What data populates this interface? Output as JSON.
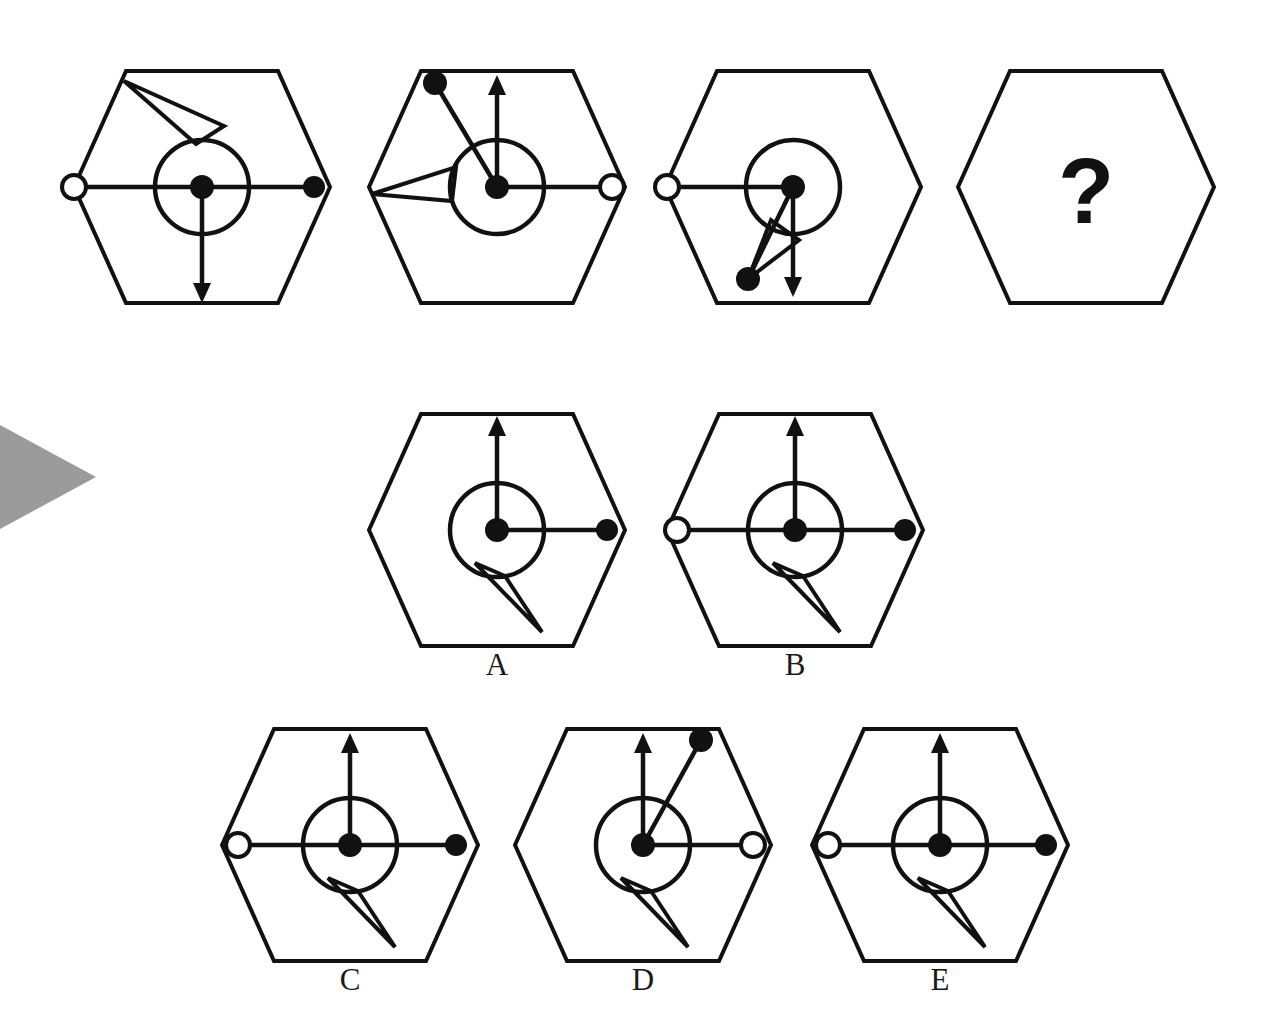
{
  "puzzle": {
    "kind": "visual-analogy-matrix",
    "question_mark": "?",
    "background_color": "#ffffff",
    "ink_color": "#111111",
    "marker_color": "#9b9b9b"
  },
  "marker": {
    "name": "row-pointer-triangle",
    "x": 0,
    "y": 425,
    "width": 96,
    "height": 104
  },
  "geometry": {
    "hex_half_width": 128,
    "hex_half_height": 116,
    "hex_flat_half": 76,
    "inner_circle_r": 47,
    "dot_r": 11,
    "open_dot_r": 12
  },
  "top_row": {
    "name": "question-row",
    "cells": [
      {
        "id": "q1",
        "cx": 202,
        "cy": 187,
        "elements": {
          "circle": true,
          "center_dot": "filled",
          "left_spoke": {
            "present": true,
            "end": "open-dot",
            "angle_deg": 180,
            "length": 128
          },
          "right_spoke": {
            "present": true,
            "end": "filled-dot",
            "angle_deg": 0,
            "length": 112
          },
          "down_arrow": {
            "present": true,
            "angle_deg": 270,
            "length": 116
          },
          "up_arrow": {
            "present": false
          },
          "wedge": {
            "present": true,
            "direction": "up-left",
            "tip_x": -78,
            "tip_y": -106,
            "open": true
          }
        }
      },
      {
        "id": "q2",
        "cx": 497,
        "cy": 187,
        "elements": {
          "circle": true,
          "center_dot": "filled",
          "left_spoke": {
            "present": false
          },
          "right_spoke": {
            "present": true,
            "end": "open-dot",
            "angle_deg": 0,
            "length": 115
          },
          "down_arrow": {
            "present": false
          },
          "up_arrow": {
            "present": true,
            "angle_deg": 90,
            "length": 112
          },
          "wedge": {
            "present": true,
            "direction": "left",
            "tip_x": -125,
            "tip_y": 7,
            "open": true
          },
          "diag_dot_line": {
            "present": true,
            "end_x": -62,
            "end_y": -104,
            "end": "filled-dot"
          }
        }
      },
      {
        "id": "q3",
        "cx": 793,
        "cy": 187,
        "elements": {
          "circle": true,
          "center_dot": "filled",
          "left_spoke": {
            "present": true,
            "end": "open-dot",
            "angle_deg": 180,
            "length": 126
          },
          "right_spoke": {
            "present": false
          },
          "down_arrow": {
            "present": true,
            "angle_deg": 270,
            "length": 110
          },
          "up_arrow": {
            "present": false
          },
          "wedge": {
            "present": true,
            "direction": "down-left",
            "tip_x": -45,
            "tip_y": 92,
            "open": true
          },
          "diag_dot_line": {
            "present": true,
            "end_x": -45,
            "end_y": 92,
            "end": "filled-dot"
          }
        }
      },
      {
        "id": "q4",
        "cx": 1086,
        "cy": 187,
        "elements": {
          "question_mark": true
        }
      }
    ]
  },
  "answers": {
    "name": "answer-options",
    "options": [
      {
        "label": "A",
        "cx": 497,
        "cy": 530,
        "label_x": 497,
        "label_y": 665,
        "elements": {
          "circle": true,
          "center_dot": "filled",
          "left_spoke": {
            "present": false
          },
          "right_spoke": {
            "present": true,
            "end": "filled-dot",
            "angle_deg": 0,
            "length": 110
          },
          "up_arrow": {
            "present": true,
            "angle_deg": 90,
            "length": 114
          },
          "wedge": {
            "present": true,
            "direction": "down-right",
            "tip_x": 45,
            "tip_y": 102,
            "open": true
          }
        }
      },
      {
        "label": "B",
        "cx": 795,
        "cy": 530,
        "label_x": 795,
        "label_y": 665,
        "elements": {
          "circle": true,
          "center_dot": "filled",
          "left_spoke": {
            "present": true,
            "end": "open-dot",
            "angle_deg": 180,
            "length": 118
          },
          "right_spoke": {
            "present": true,
            "end": "filled-dot",
            "angle_deg": 0,
            "length": 110
          },
          "up_arrow": {
            "present": true,
            "angle_deg": 90,
            "length": 114
          },
          "wedge": {
            "present": true,
            "direction": "down-right",
            "tip_x": 45,
            "tip_y": 102,
            "open": true
          }
        }
      },
      {
        "label": "C",
        "cx": 350,
        "cy": 845,
        "label_x": 350,
        "label_y": 980,
        "elements": {
          "circle": true,
          "center_dot": "filled",
          "left_spoke": {
            "present": true,
            "end": "open-dot",
            "angle_deg": 180,
            "length": 112
          },
          "right_spoke": {
            "present": true,
            "end": "filled-dot",
            "angle_deg": 0,
            "length": 106
          },
          "up_arrow": {
            "present": true,
            "angle_deg": 90,
            "length": 112
          },
          "wedge": {
            "present": true,
            "direction": "down-right",
            "tip_x": 45,
            "tip_y": 102,
            "open": true
          }
        }
      },
      {
        "label": "D",
        "cx": 643,
        "cy": 845,
        "label_x": 643,
        "label_y": 980,
        "elements": {
          "circle": true,
          "center_dot": "filled",
          "left_spoke": {
            "present": false
          },
          "right_spoke": {
            "present": true,
            "end": "open-dot",
            "angle_deg": 0,
            "length": 110
          },
          "up_arrow": {
            "present": true,
            "angle_deg": 90,
            "length": 112
          },
          "wedge": {
            "present": true,
            "direction": "down-right",
            "tip_x": 45,
            "tip_y": 102,
            "open": true
          },
          "diag_dot_line": {
            "present": true,
            "end_x": 58,
            "end_y": -105,
            "end": "filled-dot"
          }
        }
      },
      {
        "label": "E",
        "cx": 940,
        "cy": 845,
        "label_x": 940,
        "label_y": 980,
        "elements": {
          "circle": true,
          "center_dot": "filled",
          "left_spoke": {
            "present": true,
            "end": "open-dot",
            "angle_deg": 180,
            "length": 112
          },
          "right_spoke": {
            "present": true,
            "end": "filled-dot",
            "angle_deg": 0,
            "length": 106
          },
          "up_arrow": {
            "present": true,
            "angle_deg": 90,
            "length": 112
          },
          "wedge": {
            "present": true,
            "direction": "down-right",
            "tip_x": 45,
            "tip_y": 102,
            "open": true
          }
        }
      }
    ]
  }
}
